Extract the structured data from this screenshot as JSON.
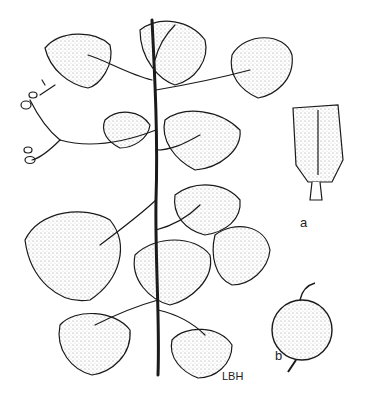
{
  "figure": {
    "labels": {
      "a": "a",
      "b": "b",
      "signature": "LBH"
    },
    "caption_fragment": "",
    "colors": {
      "ink": "#1a1a1a",
      "paper": "#ffffff"
    }
  }
}
